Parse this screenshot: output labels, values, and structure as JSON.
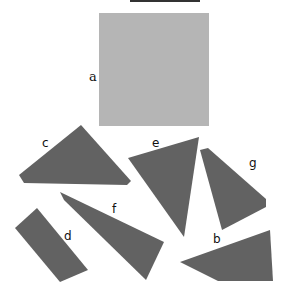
{
  "title_partial": "",
  "colors": {
    "square": "#b5b5b5",
    "piece": "#626262",
    "label": "#111111"
  },
  "shapes": [
    {
      "id": "a",
      "label": "a",
      "type": "square"
    },
    {
      "id": "b",
      "label": "b",
      "type": "quadrilateral"
    },
    {
      "id": "c",
      "label": "c",
      "type": "triangle"
    },
    {
      "id": "d",
      "label": "d",
      "type": "rectangle"
    },
    {
      "id": "e",
      "label": "e",
      "type": "triangle"
    },
    {
      "id": "f",
      "label": "f",
      "type": "quadrilateral"
    },
    {
      "id": "g",
      "label": "g",
      "type": "quadrilateral"
    }
  ]
}
